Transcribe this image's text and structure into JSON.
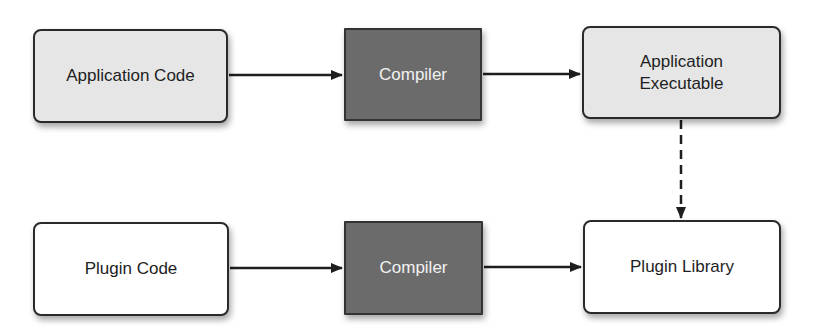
{
  "diagram": {
    "title": "",
    "nodes": [
      {
        "id": "app_code",
        "label": "Application Code",
        "style": "light-rounded"
      },
      {
        "id": "compiler_1",
        "label": "Compiler",
        "style": "dark-square"
      },
      {
        "id": "app_exec",
        "label": "Application\nExecutable",
        "label_line1": "Application",
        "label_line2": "Executable",
        "style": "light-rounded"
      },
      {
        "id": "plugin_code",
        "label": "Plugin Code",
        "style": "white-rounded"
      },
      {
        "id": "compiler_2",
        "label": "Compiler",
        "style": "dark-square"
      },
      {
        "id": "plugin_lib",
        "label": "Plugin Library",
        "style": "white-rounded"
      }
    ],
    "edges": [
      {
        "from": "app_code",
        "to": "compiler_1",
        "style": "solid"
      },
      {
        "from": "compiler_1",
        "to": "app_exec",
        "style": "solid"
      },
      {
        "from": "app_exec",
        "to": "plugin_lib",
        "style": "dashed"
      },
      {
        "from": "plugin_code",
        "to": "compiler_2",
        "style": "solid"
      },
      {
        "from": "compiler_2",
        "to": "plugin_lib",
        "style": "solid"
      }
    ],
    "colors": {
      "light_fill": "#e6e6e6",
      "dark_fill": "#6b6b6b",
      "white_fill": "#ffffff",
      "stroke": "#2a2a2a",
      "dark_text": "#f2f2f2"
    }
  }
}
